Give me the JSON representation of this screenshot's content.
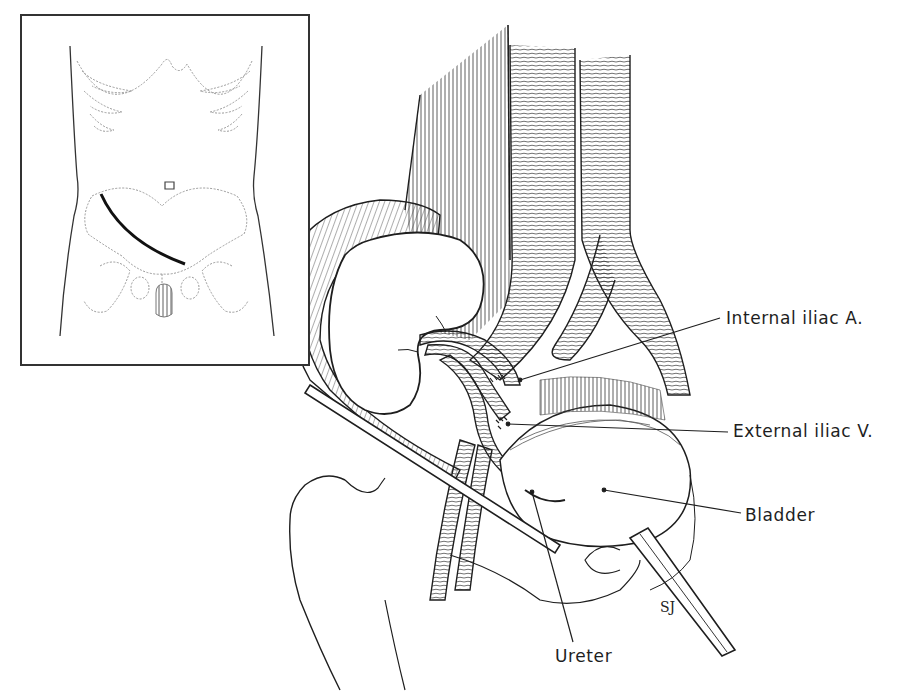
{
  "figure": {
    "type": "surgical anatomical illustration",
    "ink_color": "#1e1e1e",
    "background": "#ffffff"
  },
  "inset": {
    "description": "Frontal torso outline with ribs, umbilicus, pelvis and oblique lower-quadrant incision",
    "incision_color": "#111111",
    "dotted_bone_color": "#9a9a9a"
  },
  "labels": [
    {
      "id": "internal-iliac-artery",
      "text": "Internal iliac A.",
      "x": 726,
      "y": 310
    },
    {
      "id": "external-iliac-vein",
      "text": "External iliac V.",
      "x": 733,
      "y": 423
    },
    {
      "id": "bladder",
      "text": "Bladder",
      "x": 745,
      "y": 507
    },
    {
      "id": "ureter",
      "text": "Ureter",
      "x": 555,
      "y": 646
    }
  ],
  "leaders": [
    {
      "label": "internal-iliac-artery",
      "from": [
        720,
        318
      ],
      "to": [
        520,
        380
      ]
    },
    {
      "label": "external-iliac-vein",
      "from": [
        728,
        432
      ],
      "to": [
        508,
        424
      ]
    },
    {
      "label": "bladder",
      "from": [
        741,
        513
      ],
      "to": [
        604,
        490
      ]
    },
    {
      "label": "ureter",
      "from": [
        573,
        648
      ],
      "to": [
        532,
        492
      ]
    }
  ],
  "signature": "SJ"
}
